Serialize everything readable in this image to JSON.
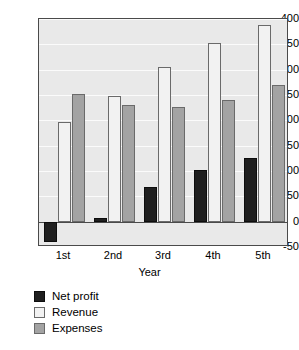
{
  "chart_data": {
    "type": "bar",
    "title": "",
    "xlabel": "Year",
    "ylabel": "",
    "categories": [
      "1st",
      "2nd",
      "3rd",
      "4th",
      "5th"
    ],
    "series": [
      {
        "name": "Net profit",
        "color": "#1f1f1f",
        "values": [
          -40,
          8,
          68,
          102,
          125
        ]
      },
      {
        "name": "Revenue",
        "color": "#f2f2f2",
        "values": [
          196,
          248,
          306,
          352,
          389
        ]
      },
      {
        "name": "Expenses",
        "color": "#a3a3a3",
        "values": [
          251,
          231,
          226,
          241,
          269
        ]
      }
    ],
    "ylim": [
      -50,
      400
    ],
    "yticks": [
      -50,
      0,
      50,
      100,
      150,
      200,
      250,
      300,
      350,
      400
    ],
    "ytick_labels": [
      "-50",
      "0",
      "50",
      "100",
      "150",
      "200",
      "250",
      "300",
      "350",
      "400"
    ],
    "grid": true,
    "legend_position": "bottom-left",
    "plot_background": "#e9e9e9",
    "axis_color": "#4a4a4a"
  }
}
